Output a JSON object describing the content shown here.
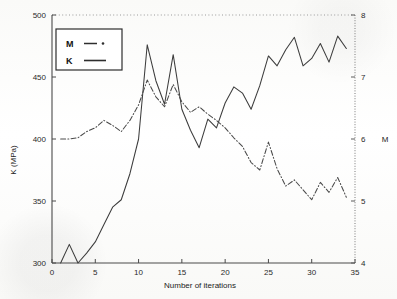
{
  "chart_data": {
    "type": "line",
    "title": "",
    "xlabel": "Number of iterations",
    "ylabel": "K (MPa)",
    "y2label": "M",
    "xlim": [
      0,
      35
    ],
    "ylim": [
      300,
      500
    ],
    "y2lim": [
      4,
      8
    ],
    "xticks": [
      0,
      5,
      10,
      15,
      20,
      25,
      30,
      35
    ],
    "yticks": [
      300,
      350,
      400,
      450,
      500
    ],
    "y2ticks": [
      4,
      5,
      6,
      7,
      8
    ],
    "xtick_labels": [
      "0",
      "5",
      "10",
      "15",
      "20",
      "25",
      "30",
      "35"
    ],
    "ytick_labels": [
      "300",
      "350",
      "400",
      "450",
      "500"
    ],
    "y2tick_labels": [
      "4",
      "5",
      "6",
      "7",
      "8"
    ],
    "grid": "top-dotted-only",
    "legend_position": "upper-left",
    "legend_entries": [
      {
        "name": "M",
        "style": "dash-dot",
        "axis": "right"
      },
      {
        "name": "K",
        "style": "solid",
        "axis": "left"
      }
    ],
    "x": [
      1,
      2,
      3,
      4,
      5,
      6,
      7,
      8,
      9,
      10,
      11,
      12,
      13,
      14,
      15,
      16,
      17,
      18,
      19,
      20,
      21,
      22,
      23,
      24,
      25,
      26,
      27,
      28,
      29,
      30,
      31,
      32,
      33,
      34
    ],
    "series": [
      {
        "name": "K",
        "axis": "left",
        "unit": "MPa",
        "style": "solid",
        "values": [
          300,
          315,
          300,
          308,
          317,
          331,
          345,
          351,
          372,
          400,
          476,
          447,
          428,
          468,
          424,
          407,
          393,
          416,
          409,
          429,
          442,
          437,
          424,
          443,
          467,
          459,
          472,
          482,
          459,
          465,
          477,
          462,
          483,
          473
        ]
      },
      {
        "name": "M",
        "axis": "right",
        "unit": "",
        "style": "dash-dot",
        "values": [
          6.0,
          6.0,
          6.02,
          6.12,
          6.18,
          6.3,
          6.22,
          6.12,
          6.3,
          6.55,
          6.95,
          6.68,
          6.52,
          6.88,
          6.6,
          6.43,
          6.52,
          6.4,
          6.3,
          6.18,
          6.02,
          5.88,
          5.62,
          5.5,
          5.95,
          5.52,
          5.24,
          5.34,
          5.18,
          5.02,
          5.3,
          5.14,
          5.38,
          5.06
        ]
      }
    ]
  },
  "axes": {
    "left_title": "K (MPa)",
    "right_title": "M",
    "bottom_title": "Number of iterations"
  },
  "legend": {
    "items": [
      {
        "label": "M",
        "dash": "dash-dot"
      },
      {
        "label": "K",
        "dash": "solid"
      }
    ]
  }
}
